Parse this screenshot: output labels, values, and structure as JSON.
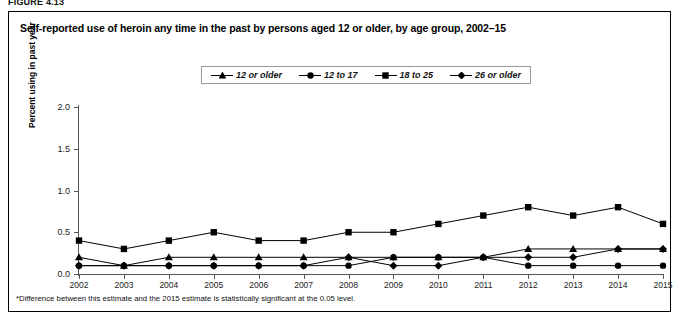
{
  "figure_label": "FIGURE 4.13",
  "title": "Self-reported use of heroin any time in the past by persons aged 12 or older, by age group, 2002–15",
  "footnote": "*Difference between this estimate and the 2015 estimate is statistically significant at the 0.05 level.",
  "legend": {
    "items": [
      {
        "label": "12 or older",
        "marker": "triangle"
      },
      {
        "label": "12 to 17",
        "marker": "circle"
      },
      {
        "label": "18 to 25",
        "marker": "square"
      },
      {
        "label": "26 or older",
        "marker": "diamond"
      }
    ]
  },
  "chart_data": {
    "type": "line",
    "title": "Self-reported use of heroin any time in the past by persons aged 12 or older, by age group, 2002–15",
    "xlabel": "",
    "ylabel": "Percent using in past year",
    "categories": [
      "2002",
      "2003",
      "2004",
      "2005",
      "2006",
      "2007",
      "2008",
      "2009",
      "2010",
      "2011",
      "2012",
      "2013",
      "2014",
      "2015"
    ],
    "xtick_labels": [
      "2002",
      "2003",
      "2004",
      "2005",
      "2006",
      "2007",
      "2008",
      "2009",
      "2010",
      "2011",
      "2012",
      "2013",
      "2014",
      "2015"
    ],
    "ytick_labels": [
      "0.0",
      "0.5",
      "1.0",
      "1.5",
      "2.0"
    ],
    "ytick_values": [
      0.0,
      0.5,
      1.0,
      1.5,
      2.0
    ],
    "ylim": [
      0.0,
      2.0
    ],
    "grid": false,
    "legend_position": "top-center",
    "series": [
      {
        "name": "12 or older",
        "marker": "triangle",
        "color": "#000000",
        "values": [
          0.2,
          0.1,
          0.2,
          0.2,
          0.2,
          0.2,
          0.2,
          0.2,
          0.2,
          0.2,
          0.3,
          0.3,
          0.3,
          0.3
        ]
      },
      {
        "name": "12 to 17",
        "marker": "circle",
        "color": "#000000",
        "values": [
          0.1,
          0.1,
          0.1,
          0.1,
          0.1,
          0.1,
          0.1,
          0.2,
          0.2,
          0.2,
          0.1,
          0.1,
          0.1,
          0.1
        ]
      },
      {
        "name": "18 to 25",
        "marker": "square",
        "color": "#000000",
        "values": [
          0.4,
          0.3,
          0.4,
          0.5,
          0.4,
          0.4,
          0.5,
          0.5,
          0.6,
          0.7,
          0.8,
          0.7,
          0.8,
          0.6
        ]
      },
      {
        "name": "26 or older",
        "marker": "diamond",
        "color": "#000000",
        "values": [
          0.1,
          0.1,
          0.1,
          0.1,
          0.1,
          0.1,
          0.2,
          0.1,
          0.1,
          0.2,
          0.2,
          0.2,
          0.3,
          0.3
        ]
      }
    ]
  }
}
